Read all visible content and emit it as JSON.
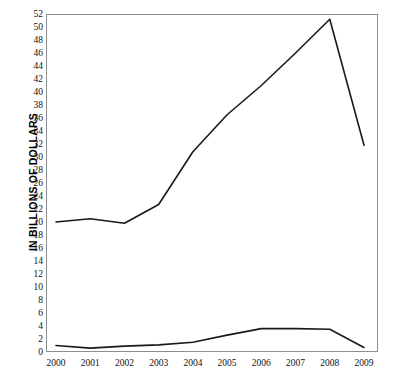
{
  "chart_data": {
    "type": "line",
    "title": "",
    "subtitle": "",
    "xlabel": "",
    "ylabel": "IN BILLIONS OF DOLLARS",
    "categories": [
      "2000",
      "2001",
      "2002",
      "2003",
      "2004",
      "2005",
      "2006",
      "2007",
      "2008",
      "2009"
    ],
    "x": [
      2000,
      2001,
      2002,
      2003,
      2004,
      2005,
      2006,
      2007,
      2008,
      2009
    ],
    "series": [
      {
        "name": "upper-series",
        "values": [
          20.0,
          20.5,
          19.8,
          22.7,
          30.8,
          36.5,
          41.0,
          46.0,
          51.2,
          31.8
        ],
        "color": "#1a1a1a"
      },
      {
        "name": "lower-series",
        "values": [
          1.0,
          0.6,
          0.9,
          1.1,
          1.5,
          2.6,
          3.6,
          3.6,
          3.5,
          0.7
        ],
        "color": "#1a1a1a"
      }
    ],
    "ylim": [
      0,
      52
    ],
    "xlim": [
      2000,
      2009
    ],
    "y_ticks": [
      0,
      2,
      4,
      6,
      8,
      10,
      12,
      14,
      16,
      18,
      20,
      22,
      24,
      26,
      28,
      30,
      32,
      34,
      36,
      38,
      40,
      42,
      44,
      46,
      48,
      50,
      52
    ],
    "y_tick_labels": [
      "0",
      "2",
      "4",
      "6",
      "8",
      "10",
      "12",
      "14",
      "16",
      "18",
      "20",
      "22",
      "24",
      "26",
      "28",
      "30",
      "32",
      "34",
      "36",
      "38",
      "40",
      "42",
      "44",
      "46",
      "48",
      "50",
      "52"
    ],
    "grid": false,
    "legend": null,
    "legend_position": "none",
    "annotations": []
  },
  "axes": {
    "y_title": "IN BILLIONS OF DOLLARS"
  },
  "watermark": {
    "line1": "",
    "line2": ""
  },
  "colors": {
    "line": "#1a1a1a",
    "frame": "#8d8d8d",
    "text": "#111111",
    "background": "#ffffff"
  }
}
